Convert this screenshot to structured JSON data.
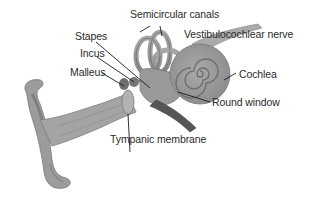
{
  "diagram": {
    "labels": {
      "semicircular_canals": "Semicircular canals",
      "vestibulocochlear_nerve": "Vestibulocochlear nerve",
      "stapes": "Stapes",
      "incus": "Incus",
      "malleus": "Malleus",
      "cochlea": "Cochlea",
      "round_window": "Round window",
      "tympanic_membrane": "Tympanic membrane"
    },
    "colors": {
      "background": "#ffffff",
      "tissue": "#9a9a9a",
      "tissue_dark": "#6e6e6e",
      "text": "#2a2a2a",
      "leader_line": "#1a1a1a"
    }
  }
}
